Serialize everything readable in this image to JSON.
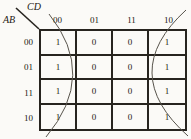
{
  "kmap": {
    "col_var_label": "CD",
    "row_var_label": "AB",
    "col_headers": [
      "00",
      "01",
      "11",
      "10"
    ],
    "row_headers": [
      "00",
      "01",
      "11",
      "10"
    ],
    "cells": [
      [
        "1",
        "0",
        "0",
        "1"
      ],
      [
        "1",
        "0",
        "0",
        "1"
      ],
      [
        "1",
        "0",
        "0",
        "1"
      ],
      [
        "1",
        "0",
        "0",
        "1"
      ]
    ],
    "groups": [
      {
        "name": "left-edge-wrap-group",
        "covers": "column CD=00"
      },
      {
        "name": "right-edge-wrap-group",
        "covers": "column CD=10"
      }
    ],
    "colors": {
      "grid_line": "#27241f",
      "arc_line": "#57534b",
      "text": "#1b1812",
      "background": "#fbfaf7"
    }
  }
}
